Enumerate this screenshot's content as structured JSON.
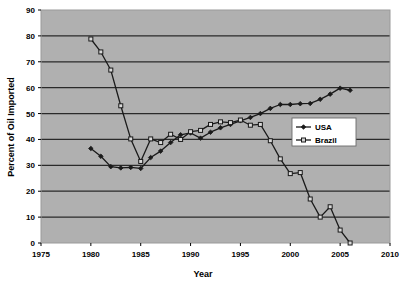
{
  "chart_data": {
    "type": "line",
    "title": "",
    "xlabel": "Year",
    "ylabel": "Percent of Oil Imported",
    "xlim": [
      1975,
      2010
    ],
    "ylim": [
      0,
      90
    ],
    "xticks": [
      1975,
      1980,
      1985,
      1990,
      1995,
      2000,
      2005,
      2010
    ],
    "yticks": [
      0,
      10,
      20,
      30,
      40,
      50,
      60,
      70,
      80,
      90
    ],
    "grid": "horizontal",
    "legend_position": "center-right",
    "plot_background": "#b0b0b0",
    "series": [
      {
        "name": "USA",
        "marker": "filled-diamond",
        "color": "#1a1a1a",
        "x": [
          1980,
          1981,
          1982,
          1983,
          1984,
          1985,
          1986,
          1987,
          1988,
          1989,
          1990,
          1991,
          1992,
          1993,
          1994,
          1995,
          1996,
          1997,
          1998,
          1999,
          2000,
          2001,
          2002,
          2003,
          2004,
          2005,
          2006
        ],
        "y": [
          36.5,
          33.5,
          29.5,
          29.0,
          29.2,
          28.8,
          33.0,
          35.5,
          38.8,
          41.8,
          42.5,
          40.5,
          42.8,
          44.5,
          45.8,
          47.2,
          48.5,
          50.0,
          52.0,
          53.5,
          53.5,
          53.8,
          53.9,
          55.5,
          57.5,
          59.8,
          59.0
        ]
      },
      {
        "name": "Brazil",
        "marker": "open-square",
        "color": "#1a1a1a",
        "x": [
          1980,
          1981,
          1982,
          1983,
          1984,
          1985,
          1986,
          1987,
          1988,
          1989,
          1990,
          1991,
          1992,
          1993,
          1994,
          1995,
          1996,
          1997,
          1998,
          1999,
          2000,
          2001,
          2002,
          2003,
          2004,
          2005,
          2006
        ],
        "y": [
          78.8,
          73.8,
          66.8,
          53.0,
          40.2,
          31.5,
          40.2,
          38.8,
          42.0,
          40.0,
          43.0,
          43.5,
          45.8,
          46.8,
          46.5,
          47.5,
          45.5,
          45.8,
          39.5,
          32.5,
          26.8,
          27.2,
          17.0,
          10.0,
          14.0,
          5.0,
          0.0
        ]
      }
    ],
    "legend_entries": [
      {
        "label": "USA",
        "marker": "filled-diamond"
      },
      {
        "label": "Brazil",
        "marker": "open-square"
      }
    ]
  }
}
